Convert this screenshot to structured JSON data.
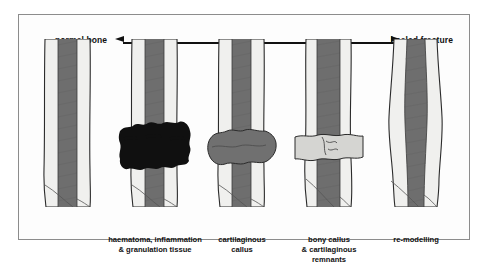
{
  "figure": {
    "axis": {
      "left_label": "normal bone",
      "right_label": "healed fracture",
      "arrow_left_icon": "arrow-left-icon",
      "arrow_right_icon": "arrow-right-icon"
    },
    "colors": {
      "panel_bg": "#fdfdfd",
      "panel_border": "#8c8c8c",
      "cortex_light": "#f0f0ee",
      "marrow_dark": "#6e6e6e",
      "callus_mid": "#707070",
      "callus_light": "#d5d5d2",
      "haematoma_black": "#101010",
      "outline": "#2b2b2b",
      "axis_line": "#111111"
    },
    "stages": [
      {
        "id": "normal-bone",
        "caption": "",
        "description": "straight shaft, intact cortex and marrow",
        "callus_type": "none"
      },
      {
        "id": "haematoma",
        "caption_line1": "haematoma, inflammation",
        "caption_line2": "& granulation tissue",
        "description": "irregular black blood clot surrounding fracture line",
        "callus_type": "haematoma"
      },
      {
        "id": "cartilaginous-callus",
        "caption_line1": "cartilaginous",
        "caption_line2": "callus",
        "description": "fusiform mid-grey soft callus bridging fracture",
        "callus_type": "soft"
      },
      {
        "id": "bony-callus",
        "caption_line1": "bony callus",
        "caption_line2": "& cartilaginous",
        "caption_line3": "remnants",
        "description": "pale mineralised band with residual fracture line",
        "callus_type": "bony"
      },
      {
        "id": "re-modelling",
        "caption_line1": "re-modelling",
        "caption_line2": "",
        "description": "gently bulged contour, restored cortex and marrow",
        "callus_type": "remodelled"
      }
    ]
  }
}
